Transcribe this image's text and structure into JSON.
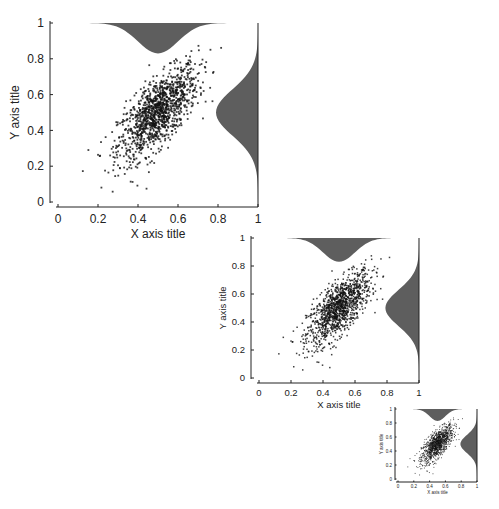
{
  "chart_data": [
    {
      "type": "scatter",
      "title": "",
      "xlabel": "X axis title",
      "ylabel": "Y axis title",
      "xlim": [
        0,
        1
      ],
      "ylim": [
        0,
        1
      ],
      "xticks": [
        "0",
        "0.2",
        "0.4",
        "0.6",
        "0.8",
        "1"
      ],
      "yticks": [
        "0",
        "0.2",
        "0.4",
        "0.6",
        "0.8",
        "1"
      ],
      "grid": false,
      "legend": null,
      "series": [
        {
          "name": "points",
          "n_points": 1200,
          "x_mean": 0.5,
          "y_mean": 0.5,
          "x_sd": 0.1,
          "y_sd": 0.13,
          "correlation": 0.7
        }
      ],
      "marginals": {
        "top": {
          "type": "density",
          "orientation": "inverted",
          "peak_x": 0.5,
          "color": "#5e5e5e"
        },
        "right": {
          "type": "density",
          "orientation": "leftward",
          "peak_y": 0.5,
          "color": "#5e5e5e"
        }
      },
      "size": "large"
    },
    {
      "type": "scatter",
      "xlabel": "X axis title",
      "ylabel": "Y axis title",
      "xlim": [
        0,
        1
      ],
      "ylim": [
        0,
        1
      ],
      "xticks": [
        "0",
        "0.2",
        "0.4",
        "0.6",
        "0.8",
        "1"
      ],
      "yticks": [
        "0",
        "0.2",
        "0.4",
        "0.6",
        "0.8",
        "1"
      ],
      "size": "medium"
    },
    {
      "type": "scatter",
      "xlabel": "X axis title",
      "ylabel": "Y axis title",
      "xlim": [
        0,
        1
      ],
      "ylim": [
        0,
        1
      ],
      "xticks": [
        "0",
        "0.2",
        "0.4",
        "0.6",
        "0.8",
        "1"
      ],
      "yticks": [
        "0",
        "0.2",
        "0.4",
        "0.6",
        "0.8",
        "1"
      ],
      "size": "small"
    }
  ],
  "layout": {
    "panels": [
      {
        "ax": 50,
        "x0": 58,
        "x1": 258,
        "y0": 202,
        "y1": 23,
        "xaxisY": 207,
        "font": 12,
        "title_font": 12
      },
      {
        "ax": 251,
        "x0": 259,
        "x1": 419,
        "y0": 378,
        "y1": 238,
        "xaxisY": 383,
        "font": 9.5,
        "title_font": 9.5
      },
      {
        "ax": 395,
        "x0": 398,
        "x1": 477,
        "y0": 479,
        "y1": 409,
        "xaxisY": 482,
        "font": 4.5,
        "title_font": 4.5
      }
    ]
  }
}
